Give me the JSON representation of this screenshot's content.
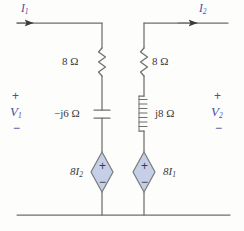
{
  "figure": {
    "background_color": "#fdfdfc",
    "ink_color": "#3a3a3a",
    "annotation_color": "#4a4fa0",
    "source_fill_color": "#c5cfe8"
  },
  "currents": {
    "left": {
      "symbol": "I",
      "subscript": "1",
      "direction": "right"
    },
    "right": {
      "symbol": "I",
      "subscript": "2",
      "direction": "right"
    }
  },
  "voltages": {
    "left": {
      "symbol": "V",
      "subscript": "1",
      "plus": "+",
      "minus": "−"
    },
    "right": {
      "symbol": "V",
      "subscript": "2",
      "plus": "+",
      "minus": "−"
    }
  },
  "components": {
    "resistor_left": {
      "name": "resistor",
      "value": "8 Ω"
    },
    "resistor_right": {
      "name": "resistor",
      "value": "8 Ω"
    },
    "capacitor": {
      "name": "capacitor",
      "value": "−j6 Ω"
    },
    "inductor": {
      "name": "inductor",
      "value": "j8 Ω"
    }
  },
  "sources": {
    "left": {
      "type": "dependent-voltage-source",
      "coefficient": "8",
      "variable": "I",
      "subscript": "2",
      "plus": "+",
      "minus": "−"
    },
    "right": {
      "type": "dependent-voltage-source",
      "coefficient": "8",
      "variable": "I",
      "subscript": "1",
      "plus": "+",
      "minus": "−"
    }
  },
  "ground": {
    "label": "bottom-rail"
  }
}
